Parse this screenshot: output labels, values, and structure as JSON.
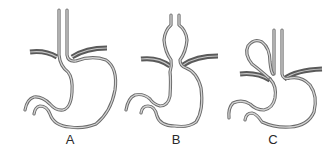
{
  "figure": {
    "type": "anatomical diagram",
    "colors": {
      "wall_outer": "#6a6a6a",
      "wall_inner": "#d4d4d4",
      "diaphragm": "#5a5a5a",
      "background": "#ffffff",
      "label": "#2a2a2a"
    },
    "panels": [
      {
        "id": "A",
        "label": "A",
        "depicts": "normal gastroesophageal junction below diaphragm"
      },
      {
        "id": "B",
        "label": "B",
        "depicts": "sliding hiatal hernia (junction and stomach bulge above diaphragm)"
      },
      {
        "id": "C",
        "label": "C",
        "depicts": "paraesophageal hernia (fundus loop rolls up beside esophagus)"
      }
    ]
  }
}
